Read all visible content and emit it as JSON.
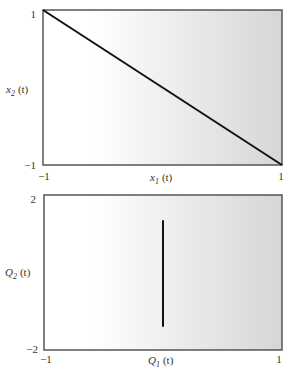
{
  "chart_data": [
    {
      "type": "line",
      "title": "",
      "xlabel": "x1 (t)",
      "ylabel": "x2 (t)",
      "xlabel_parts": {
        "var": "x",
        "sub": "1",
        "arg": "(t)"
      },
      "ylabel_parts": {
        "var": "x",
        "sub": "2",
        "arg": "(t)"
      },
      "xlim": [
        -1,
        1
      ],
      "ylim": [
        -1,
        1
      ],
      "x_ticks": [
        "-1",
        "1"
      ],
      "y_ticks": [
        "1",
        "-1"
      ],
      "grid": false,
      "background": "horizontal gradient white to light gray",
      "series": [
        {
          "name": "trajectory",
          "x": [
            -1,
            1
          ],
          "y": [
            1,
            -1
          ],
          "color": "#111111"
        }
      ]
    },
    {
      "type": "line",
      "title": "",
      "xlabel": "Q1 (t)",
      "ylabel": "Q2 (t)",
      "xlabel_parts": {
        "var": "Q",
        "sub": "1",
        "arg": "(t)"
      },
      "ylabel_parts": {
        "var": "Q",
        "sub": "2",
        "arg": "(t)"
      },
      "xlim": [
        -1,
        1
      ],
      "ylim": [
        -2,
        2
      ],
      "x_ticks": [
        "-1",
        "1"
      ],
      "y_ticks": [
        "2",
        "-2"
      ],
      "grid": false,
      "background": "horizontal gradient white to light gray",
      "series": [
        {
          "name": "trajectory",
          "x": [
            0,
            0
          ],
          "y": [
            1.35,
            -1.4
          ],
          "color": "#111111"
        }
      ]
    }
  ],
  "colors": {
    "frame": "#555555",
    "line": "#111111",
    "gradient_start": "#ffffff",
    "gradient_end": "#d6d6d6"
  }
}
